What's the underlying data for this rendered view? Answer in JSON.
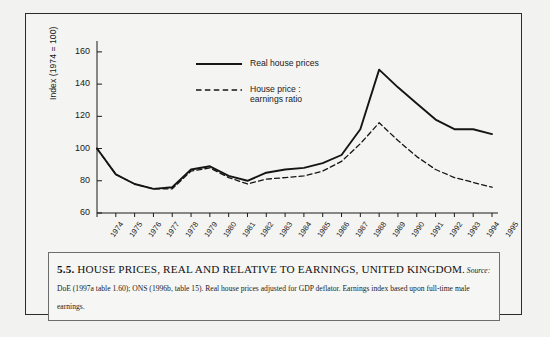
{
  "figure": {
    "caption_number": "5.5.",
    "caption_title": "HOUSE PRICES, REAL AND RELATIVE TO EARNINGS, UNITED KINGDOM.",
    "source_label": "Source:",
    "source_text": " DoE (1997a table 1.60); ONS (1996b, table 15). Real house prices adjusted for GDP deflator. Earnings index based upon full-time male earnings."
  },
  "chart_data": {
    "type": "line",
    "title": "",
    "xlabel": "",
    "ylabel": "Index (1974 = 100)",
    "ylim": [
      60,
      168
    ],
    "yticks": [
      60,
      80,
      100,
      120,
      140,
      160
    ],
    "ytick_labels": [
      "60",
      "80",
      "100",
      "120",
      "140",
      "160"
    ],
    "grid": false,
    "legend_position": "top-center",
    "categories": [
      "1974",
      "1975",
      "1976",
      "1977",
      "1978",
      "1979",
      "1980",
      "1981",
      "1982",
      "1983",
      "1984",
      "1985",
      "1986",
      "1987",
      "1988",
      "1989",
      "1990",
      "1991",
      "1992",
      "1993",
      "1994",
      "1995"
    ],
    "series": [
      {
        "name": "Real house prices",
        "style": "solid",
        "color": "#151515",
        "values": [
          100,
          84,
          78,
          75,
          76,
          87,
          89,
          83,
          80,
          85,
          87,
          88,
          91,
          96,
          112,
          149,
          138,
          128,
          118,
          112,
          112,
          109
        ]
      },
      {
        "name": "House price :\nearnings ratio",
        "style": "dashed",
        "color": "#151515",
        "values": [
          100,
          84,
          78,
          75,
          75,
          86,
          88,
          82,
          78,
          81,
          82,
          83,
          86,
          92,
          103,
          116,
          105,
          95,
          87,
          82,
          79,
          76
        ]
      }
    ]
  }
}
